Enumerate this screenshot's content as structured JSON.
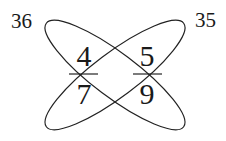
{
  "diagram": {
    "type": "crossed-ellipses-fractions",
    "corner_labels": {
      "top_left": "36",
      "top_right": "35"
    },
    "fractions": [
      {
        "numerator": "4",
        "denominator": "7"
      },
      {
        "numerator": "5",
        "denominator": "9"
      }
    ],
    "stroke_color": "#222222"
  }
}
